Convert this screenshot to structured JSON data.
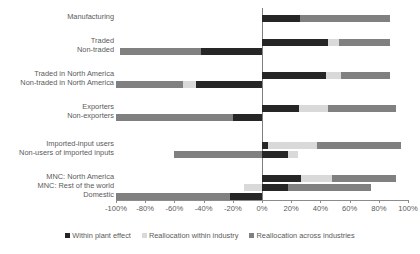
{
  "chart_data": {
    "type": "bar",
    "orientation": "horizontal",
    "stacked": true,
    "title": "",
    "xlabel": "",
    "ylabel": "",
    "xlim": [
      -100,
      100
    ],
    "xticks": [
      "-100%",
      "-80%",
      "-60%",
      "-40%",
      "-20%",
      "0%",
      "20%",
      "40%",
      "60%",
      "80%",
      "100%"
    ],
    "xtick_values": [
      -100,
      -80,
      -60,
      -40,
      -20,
      0,
      20,
      40,
      60,
      80,
      100
    ],
    "grid": false,
    "legend_position": "bottom",
    "categories": [
      "Manufacturing",
      "Traded",
      "Non-traded",
      "Traded in North America",
      "Non-traded in North America",
      "Exporters",
      "Non-exporters",
      "Imported-input users",
      "Non-users of imported inputs",
      "MNC: North America",
      "MNC: Rest of the world",
      "Domestic"
    ],
    "series": [
      {
        "name": "Within plant effect",
        "color": "#262626",
        "values": [
          26,
          45,
          -42,
          44,
          -45,
          25,
          -20,
          4,
          18,
          27,
          18,
          -22
        ]
      },
      {
        "name": "Reallocation within industry",
        "color": "#d9d9d9",
        "values": [
          0,
          8,
          0,
          10,
          -9,
          20,
          0,
          34,
          7,
          21,
          -12,
          0
        ]
      },
      {
        "name": "Reallocation across industries",
        "color": "#808080",
        "values": [
          62,
          35,
          -55,
          34,
          -46,
          47,
          -80,
          57,
          -60,
          44,
          57,
          -78
        ]
      }
    ],
    "legend": [
      {
        "label": "Within plant effect",
        "color": "#262626"
      },
      {
        "label": "Reallocation within industry",
        "color": "#d9d9d9"
      },
      {
        "label": "Reallocation across industries",
        "color": "#808080"
      }
    ]
  }
}
